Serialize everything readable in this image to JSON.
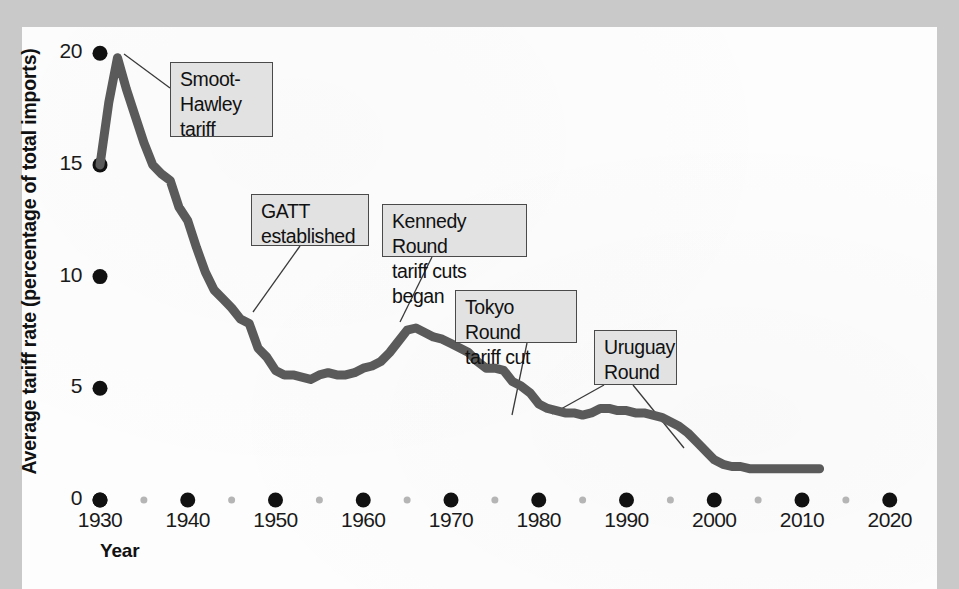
{
  "figure": {
    "background_color": "#c9c9c9",
    "page_color": "#fdfdfd",
    "line_color": "#5a5a5a",
    "tick_color": "#111111",
    "minor_tick_color": "#b5b5b5",
    "annotation_fill": "#e2e2e2",
    "annotation_border": "#4a4a4a"
  },
  "chart_data": {
    "type": "line",
    "title": "",
    "subtitle": "",
    "xlabel": "Year",
    "ylabel": "Average tariff rate (percentage of total imports)",
    "xlim": [
      1930,
      2024
    ],
    "ylim": [
      0,
      21
    ],
    "xticks": [
      1930,
      1940,
      1950,
      1960,
      1970,
      1980,
      1990,
      2000,
      2010,
      2020
    ],
    "xtick_labels": [
      "1930",
      "1940",
      "1950",
      "1960",
      "1970",
      "1980",
      "1990",
      "2000",
      "2010",
      "2020"
    ],
    "minor_xticks": [
      1935,
      1945,
      1955,
      1965,
      1975,
      1985,
      1995,
      2005,
      2015
    ],
    "yticks": [
      0,
      5,
      10,
      15,
      20
    ],
    "ytick_labels": [
      "0",
      "5",
      "10",
      "15",
      "20"
    ],
    "grid": false,
    "legend": "none",
    "series": [
      {
        "name": "Average tariff rate",
        "x": [
          1930,
          1931,
          1932,
          1933,
          1934,
          1935,
          1936,
          1937,
          1938,
          1939,
          1940,
          1941,
          1942,
          1943,
          1944,
          1945,
          1946,
          1947,
          1948,
          1949,
          1950,
          1951,
          1952,
          1953,
          1954,
          1955,
          1956,
          1957,
          1958,
          1959,
          1960,
          1961,
          1962,
          1963,
          1964,
          1965,
          1966,
          1967,
          1968,
          1969,
          1970,
          1971,
          1972,
          1973,
          1974,
          1975,
          1976,
          1977,
          1978,
          1979,
          1980,
          1981,
          1982,
          1983,
          1984,
          1985,
          1986,
          1987,
          1988,
          1989,
          1990,
          1991,
          1992,
          1993,
          1994,
          1995,
          1996,
          1997,
          1998,
          1999,
          2000,
          2001,
          2002,
          2003,
          2004,
          2005,
          2006,
          2007,
          2008,
          2009,
          2010,
          2011,
          2012
        ],
        "values": [
          15.0,
          17.8,
          19.8,
          18.4,
          17.2,
          16.0,
          15.0,
          14.6,
          14.3,
          13.1,
          12.5,
          11.3,
          10.2,
          9.4,
          9.0,
          8.6,
          8.1,
          7.9,
          6.8,
          6.4,
          5.8,
          5.6,
          5.6,
          5.5,
          5.4,
          5.6,
          5.7,
          5.6,
          5.6,
          5.7,
          5.9,
          6.0,
          6.2,
          6.6,
          7.1,
          7.6,
          7.7,
          7.5,
          7.3,
          7.2,
          7.0,
          6.8,
          6.6,
          6.2,
          5.9,
          5.9,
          5.8,
          5.3,
          5.1,
          4.8,
          4.3,
          4.1,
          4.0,
          3.9,
          3.9,
          3.8,
          3.9,
          4.1,
          4.1,
          4.0,
          4.0,
          3.9,
          3.9,
          3.8,
          3.7,
          3.5,
          3.3,
          3.0,
          2.6,
          2.2,
          1.8,
          1.6,
          1.5,
          1.5,
          1.4,
          1.4,
          1.4,
          1.4,
          1.4,
          1.4,
          1.4,
          1.4,
          1.4
        ]
      }
    ],
    "annotations": [
      {
        "id": "smoot-hawley",
        "label": "Smoot-\nHawley\ntariff",
        "box": {
          "x": 170,
          "y": 62,
          "w": 103,
          "h": 75
        },
        "leader": [
          {
            "x": 170,
            "y": 88
          },
          {
            "x": 124,
            "y": 54
          }
        ]
      },
      {
        "id": "gatt",
        "label": "GATT\nestablished",
        "box": {
          "x": 251,
          "y": 194,
          "w": 118,
          "h": 52
        },
        "leader": [
          {
            "x": 300,
            "y": 246
          },
          {
            "x": 253,
            "y": 312
          }
        ]
      },
      {
        "id": "kennedy-round",
        "label": "Kennedy Round\ntariff cuts began",
        "box": {
          "x": 382,
          "y": 204,
          "w": 145,
          "h": 53
        },
        "leader": [
          {
            "x": 432,
            "y": 257
          },
          {
            "x": 400,
            "y": 322
          }
        ]
      },
      {
        "id": "tokyo-round",
        "label": "Tokyo Round\ntariff cut",
        "box": {
          "x": 455,
          "y": 290,
          "w": 122,
          "h": 53
        },
        "leader": [
          {
            "x": 527,
            "y": 343
          },
          {
            "x": 512,
            "y": 415
          }
        ]
      },
      {
        "id": "uruguay-round",
        "label": "Uruguay\nRound",
        "box": {
          "x": 594,
          "y": 330,
          "w": 83,
          "h": 55
        },
        "leader": [
          {
            "x": 604,
            "y": 385
          },
          {
            "x": 552,
            "y": 414
          }
        ],
        "leader2": [
          {
            "x": 633,
            "y": 385
          },
          {
            "x": 684,
            "y": 448
          }
        ]
      }
    ]
  }
}
